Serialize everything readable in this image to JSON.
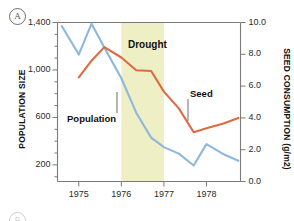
{
  "panel": {
    "tag": "A",
    "next_tag": "B"
  },
  "chart_data": {
    "type": "line",
    "title": "",
    "subtitle": "",
    "xlabel": "",
    "ylabel": "POPULATION SIZE",
    "y2label": "SEED CONSUMPTION (g/m2)",
    "grid": false,
    "legend_position": "inline-annotations",
    "x": [
      1974.6,
      1975.0,
      1975.3,
      1975.6,
      1976.0,
      1976.35,
      1976.7,
      1977.0,
      1977.35,
      1977.7,
      1978.0,
      1978.4,
      1978.75
    ],
    "xlim": [
      1974.5,
      1978.8
    ],
    "xticks": [
      1975,
      1976,
      1977,
      1978
    ],
    "xtick_labels": [
      "1975",
      "1976",
      "1977",
      "1978"
    ],
    "ylim": [
      60,
      1400
    ],
    "yticks": [
      200,
      600,
      1000,
      1400
    ],
    "ytick_labels": [
      "200",
      "600",
      "1,000",
      "1,400"
    ],
    "y2lim": [
      0.0,
      10.0
    ],
    "y2ticks": [
      0.0,
      2.0,
      4.0,
      6.0,
      8.0,
      10.0
    ],
    "y2tick_labels": [
      "0.0",
      "2.0",
      "4.0",
      "6.0",
      "8.0",
      "10.0"
    ],
    "series": [
      {
        "name": "Population",
        "axis": "left",
        "color": "#8EB8DB",
        "values": [
          1370,
          1130,
          1390,
          1190,
          930,
          640,
          430,
          350,
          295,
          195,
          375,
          290,
          235
        ]
      },
      {
        "name": "Seed",
        "axis": "right",
        "color": "#DD6A43",
        "values": [
          null,
          6.55,
          7.6,
          8.45,
          7.8,
          7.0,
          6.95,
          5.65,
          4.6,
          3.1,
          3.35,
          3.65,
          4.0
        ]
      }
    ],
    "annotations": [
      {
        "text": "Drought",
        "type": "shaded-band",
        "x_start": 1976.0,
        "x_end": 1977.0,
        "color": "#EFEFC6"
      },
      {
        "text": "Population",
        "type": "leader-label"
      },
      {
        "text": "Seed",
        "type": "leader-label"
      }
    ]
  }
}
